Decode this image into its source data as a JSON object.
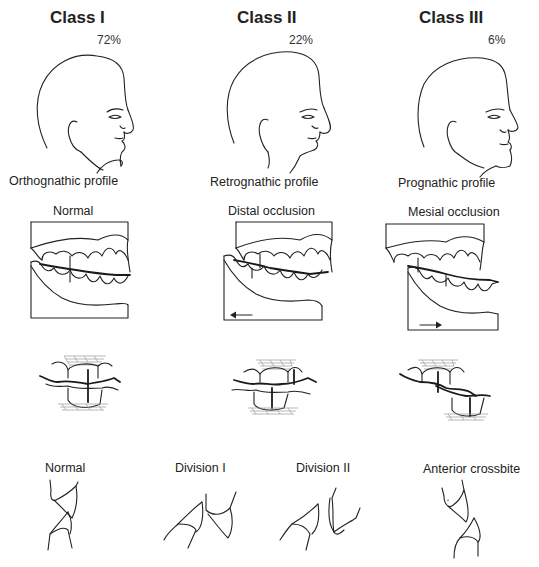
{
  "diagram": {
    "columns": [
      {
        "class_title": "Class I",
        "percentage": "72%",
        "profile_label": "Orthognathic profile",
        "occlusion_label": "Normal",
        "incisor_label": "Normal"
      },
      {
        "class_title": "Class II",
        "percentage": "22%",
        "profile_label": "Retrognathic profile",
        "occlusion_label": "Distal occlusion",
        "incisor_labels": [
          "Division I",
          "Division II"
        ]
      },
      {
        "class_title": "Class III",
        "percentage": "6%",
        "profile_label": "Prognathic profile",
        "occlusion_label": "Mesial occlusion",
        "incisor_label": "Anterior crossbite"
      }
    ],
    "icons": {
      "distal_arrow": "arrow-left",
      "mesial_arrow": "arrow-right"
    },
    "colors": {
      "line": "#222222",
      "hatch": "#9a9a9a",
      "background": "#ffffff"
    }
  }
}
